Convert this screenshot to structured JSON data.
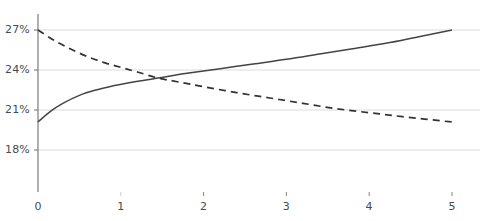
{
  "chart_data": {
    "type": "line",
    "title": "",
    "subtitle": "",
    "xlabel": "",
    "ylabel": "",
    "xlim": [
      0,
      5
    ],
    "ylim": [
      16.5,
      28.2
    ],
    "grid": true,
    "grid_axis": "y",
    "legend": "none",
    "x_ticks": [
      {
        "value": 0,
        "label": "0"
      },
      {
        "value": 1,
        "label": "1"
      },
      {
        "value": 2,
        "label": "2"
      },
      {
        "value": 3,
        "label": "3"
      },
      {
        "value": 4,
        "label": "4"
      },
      {
        "value": 5,
        "label": "5"
      }
    ],
    "y_ticks": [
      {
        "value": 27,
        "label": "27%"
      },
      {
        "value": 24,
        "label": "24%"
      },
      {
        "value": 21,
        "label": "21%"
      },
      {
        "value": 18,
        "label": "18%"
      }
    ],
    "intersection": {
      "x": 1.45,
      "y": 23.4
    },
    "series": [
      {
        "name": "increasing-curve",
        "style": "solid",
        "color": "#444444",
        "x": [
          0,
          0.15,
          0.3,
          0.5,
          0.7,
          0.9,
          1.1,
          1.45,
          1.8,
          2.2,
          2.6,
          3.0,
          3.4,
          3.8,
          4.2,
          4.6,
          5.0
        ],
        "values": [
          20.1,
          20.9,
          21.5,
          22.1,
          22.5,
          22.8,
          23.05,
          23.4,
          23.75,
          24.1,
          24.45,
          24.8,
          25.2,
          25.6,
          26.0,
          26.5,
          27.0
        ]
      },
      {
        "name": "decreasing-curve",
        "style": "dashed",
        "color": "#333333",
        "x": [
          0,
          0.2,
          0.4,
          0.6,
          0.8,
          1.0,
          1.2,
          1.45,
          1.7,
          2.0,
          2.4,
          2.8,
          3.2,
          3.6,
          4.0,
          4.4,
          5.0
        ],
        "values": [
          27.0,
          26.2,
          25.55,
          25.0,
          24.55,
          24.2,
          23.85,
          23.4,
          23.1,
          22.75,
          22.3,
          21.9,
          21.5,
          21.1,
          20.8,
          20.5,
          20.1
        ]
      }
    ]
  },
  "style": {
    "gridline_color": "#d8d8d8",
    "axis_color": "#6e6e6e",
    "tick_text_color": "#4a4a4a",
    "background": "#ffffff"
  }
}
